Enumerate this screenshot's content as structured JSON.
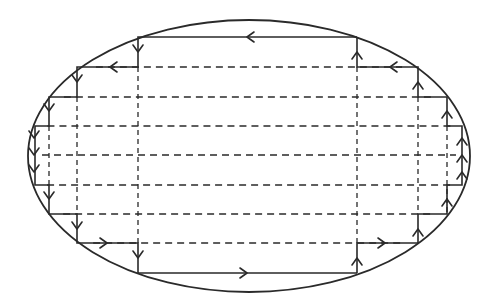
{
  "diagram": {
    "colors": {
      "stroke": "#2a2a2a",
      "background": "#ffffff"
    },
    "ellipse": {
      "cx": 249,
      "cy": 156,
      "rx": 221,
      "ry": 136
    },
    "horizontal_levels": [
      37,
      67,
      97,
      126,
      155,
      185,
      214,
      243,
      273
    ],
    "vertical_dashed": [
      49,
      77,
      138,
      357,
      418,
      447
    ],
    "stair_path_left": [
      [
        357,
        37
      ],
      [
        138,
        37
      ],
      [
        138,
        67
      ],
      [
        77,
        67
      ],
      [
        77,
        97
      ],
      [
        49,
        97
      ],
      [
        49,
        126
      ],
      [
        35,
        126
      ],
      [
        35,
        185
      ],
      [
        49,
        185
      ],
      [
        49,
        214
      ],
      [
        77,
        214
      ],
      [
        77,
        243
      ],
      [
        138,
        243
      ],
      [
        138,
        273
      ],
      [
        357,
        273
      ]
    ],
    "stair_path_right": [
      [
        357,
        273
      ],
      [
        357,
        243
      ],
      [
        418,
        243
      ],
      [
        418,
        214
      ],
      [
        447,
        214
      ],
      [
        447,
        185
      ],
      [
        462,
        185
      ],
      [
        462,
        126
      ],
      [
        447,
        126
      ],
      [
        447,
        97
      ],
      [
        418,
        97
      ],
      [
        418,
        67
      ],
      [
        357,
        67
      ],
      [
        357,
        37
      ]
    ],
    "arrows": [
      {
        "x": 247,
        "y": 37,
        "dir": "left"
      },
      {
        "x": 110,
        "y": 67,
        "dir": "left"
      },
      {
        "x": 138,
        "y": 52,
        "dir": "down"
      },
      {
        "x": 77,
        "y": 82,
        "dir": "down"
      },
      {
        "x": 49,
        "y": 111,
        "dir": "down"
      },
      {
        "x": 34,
        "y": 138,
        "dir": "down"
      },
      {
        "x": 34,
        "y": 155,
        "dir": "down"
      },
      {
        "x": 34,
        "y": 172,
        "dir": "down"
      },
      {
        "x": 49,
        "y": 199,
        "dir": "down"
      },
      {
        "x": 77,
        "y": 229,
        "dir": "down"
      },
      {
        "x": 138,
        "y": 258,
        "dir": "down"
      },
      {
        "x": 107,
        "y": 243,
        "dir": "right"
      },
      {
        "x": 247,
        "y": 273,
        "dir": "right"
      },
      {
        "x": 385,
        "y": 243,
        "dir": "right"
      },
      {
        "x": 357,
        "y": 258,
        "dir": "up"
      },
      {
        "x": 418,
        "y": 229,
        "dir": "up"
      },
      {
        "x": 447,
        "y": 199,
        "dir": "up"
      },
      {
        "x": 462,
        "y": 172,
        "dir": "up"
      },
      {
        "x": 462,
        "y": 155,
        "dir": "up"
      },
      {
        "x": 462,
        "y": 138,
        "dir": "up"
      },
      {
        "x": 447,
        "y": 111,
        "dir": "up"
      },
      {
        "x": 418,
        "y": 82,
        "dir": "up"
      },
      {
        "x": 390,
        "y": 67,
        "dir": "left"
      },
      {
        "x": 357,
        "y": 52,
        "dir": "up"
      }
    ]
  }
}
